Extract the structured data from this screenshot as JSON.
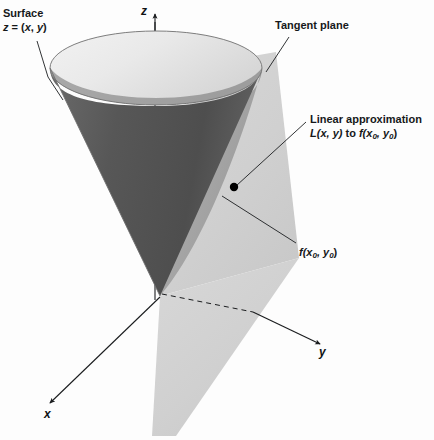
{
  "figure": {
    "background_color": "#fdfdfd"
  },
  "annotations": {
    "surface": {
      "line1": "Surface",
      "line2_lead": "z",
      "line2_eq": " = (",
      "line2_x": "x",
      "line2_comma": ", ",
      "line2_y": "y",
      "line2_close": ")"
    },
    "tangent_plane": {
      "label": "Tangent plane"
    },
    "linear_approximation": {
      "line1": "Linear approximation",
      "line2_L": "L",
      "line2_args": "(x, y)",
      "line2_to": " to ",
      "line2_f": "f",
      "line2_fopen": "(x",
      "line2_sub0a": "0",
      "line2_fmid": ", y",
      "line2_sub0b": "0",
      "line2_fclose": ")"
    },
    "point_value": {
      "f": "f",
      "open": "(x",
      "sub0a": "0",
      "mid": ", y",
      "sub0b": "0",
      "close": ")"
    }
  },
  "axes": {
    "z_label": "z",
    "y_label": "y",
    "x_label": "x"
  },
  "colors": {
    "surface_top_light": "#e6e6e6",
    "surface_inner_dark": "#5a5a5a",
    "surface_outer_mid": "#9a9a9a",
    "tangent_plane": "#d3d3d3",
    "axis_stroke": "#1b1d1f",
    "leader_stroke": "#1b1d1f",
    "point_marker": "#000000",
    "text": "#16181a"
  },
  "geometry": {
    "surface_top_ellipse": {
      "cx": 156,
      "cy": 68,
      "rx": 106,
      "ry": 37
    },
    "surface_apex": {
      "x": 160,
      "y": 296
    },
    "tangency_point": {
      "x": 234,
      "y": 187
    },
    "z_axis": {
      "x": 155,
      "y_top": 14,
      "y_bottom": 300
    },
    "y_axis_tip": {
      "x": 320,
      "y": 344
    },
    "x_axis_tip": {
      "x": 50,
      "y": 403
    }
  }
}
